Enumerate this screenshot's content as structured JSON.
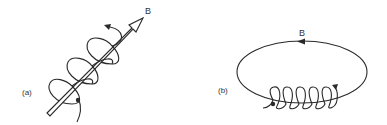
{
  "figure": {
    "panels": [
      {
        "id": "a",
        "label": "(a)",
        "field_label": "B",
        "description": "Charged particle helical motion along straight magnetic field arrow",
        "helix_turns": 3
      },
      {
        "id": "b",
        "label": "(b)",
        "field_label": "B",
        "description": "Charged particle spiraling along closed elliptical magnetic field line",
        "helix_turns": 5
      }
    ],
    "colors": {
      "stroke": "#2a2a2a",
      "background": "#ffffff"
    }
  }
}
